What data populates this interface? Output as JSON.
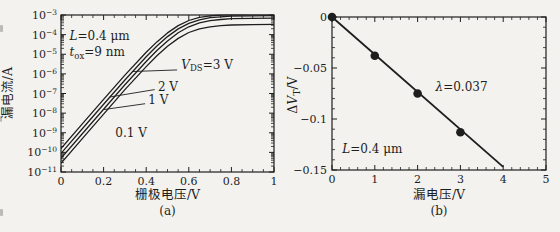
{
  "page": {
    "background": "#f3f2ee",
    "ink": "#1e1e1e"
  },
  "chart_data": [
    {
      "id": "a",
      "type": "line",
      "xlabel": "栅极电压/V",
      "ylabel": "漏电流/A",
      "caption": "(a)",
      "xlim": [
        0,
        1
      ],
      "x_ticks": [
        0,
        0.2,
        0.4,
        0.6,
        0.8,
        1
      ],
      "x_tick_labels": [
        "0",
        "0.2",
        "0.4",
        "0.6",
        "0.8",
        "1"
      ],
      "x_minor_step": 0.05,
      "y_scale": "log",
      "ylim_log": [
        -11,
        -3
      ],
      "y_exponent_ticks": [
        -3,
        -4,
        -5,
        -6,
        -7,
        -8,
        -9,
        -10,
        -11
      ],
      "grid": false,
      "annotations": [
        {
          "anchor": [
            0.04,
            -4.25
          ],
          "tokens": [
            [
              "i",
              "L"
            ],
            [
              "",
              "=0.4 μm"
            ]
          ]
        },
        {
          "anchor": [
            0.04,
            -5.1
          ],
          "tokens": [
            [
              "i",
              "t"
            ],
            [
              "sub",
              "ox"
            ],
            [
              "",
              "=9 nm"
            ]
          ]
        }
      ],
      "series": [
        {
          "name": "VDS-3V",
          "label_tokens": [
            [
              "i",
              "V"
            ],
            [
              "sub",
              "DS"
            ],
            [
              "",
              "=3 V"
            ]
          ],
          "label_anchor": [
            0.565,
            -5.75
          ],
          "leader": {
            "from": [
              0.545,
              -5.8
            ],
            "to": [
              0.335,
              -5.88
            ]
          },
          "points": [
            [
              0,
              -9.8
            ],
            [
              0.1,
              -8.55
            ],
            [
              0.2,
              -7.3
            ],
            [
              0.3,
              -6.06
            ],
            [
              0.4,
              -4.9
            ],
            [
              0.45,
              -4.37
            ],
            [
              0.5,
              -3.91
            ],
            [
              0.55,
              -3.54
            ],
            [
              0.6,
              -3.28
            ],
            [
              0.65,
              -3.12
            ],
            [
              0.7,
              -3.04
            ],
            [
              0.75,
              -3.0
            ],
            [
              0.8,
              -2.98
            ],
            [
              0.9,
              -2.96
            ],
            [
              1,
              -2.95
            ]
          ]
        },
        {
          "name": "VDS-2V",
          "label_tokens": [
            [
              "",
              "2 V"
            ]
          ],
          "label_anchor": [
            0.455,
            -6.88
          ],
          "leader": {
            "from": [
              0.44,
              -6.8
            ],
            "to": [
              0.228,
              -7.18
            ]
          },
          "points": [
            [
              0,
              -10.05
            ],
            [
              0.1,
              -8.8
            ],
            [
              0.2,
              -7.55
            ],
            [
              0.3,
              -6.31
            ],
            [
              0.4,
              -5.13
            ],
            [
              0.45,
              -4.58
            ],
            [
              0.5,
              -4.1
            ],
            [
              0.55,
              -3.71
            ],
            [
              0.6,
              -3.43
            ],
            [
              0.65,
              -3.25
            ],
            [
              0.7,
              -3.14
            ],
            [
              0.75,
              -3.09
            ],
            [
              0.8,
              -3.05
            ],
            [
              0.9,
              -3.04
            ],
            [
              1,
              -3.03
            ]
          ]
        },
        {
          "name": "VDS-1V",
          "label_tokens": [
            [
              "",
              "1 V"
            ]
          ],
          "label_anchor": [
            0.41,
            -7.55
          ],
          "leader": {
            "from": [
              0.395,
              -7.52
            ],
            "to": [
              0.2,
              -7.82
            ]
          },
          "points": [
            [
              0,
              -10.3
            ],
            [
              0.1,
              -9.05
            ],
            [
              0.2,
              -7.8
            ],
            [
              0.3,
              -6.55
            ],
            [
              0.4,
              -5.37
            ],
            [
              0.45,
              -4.81
            ],
            [
              0.5,
              -4.32
            ],
            [
              0.55,
              -3.9
            ],
            [
              0.6,
              -3.6
            ],
            [
              0.65,
              -3.4
            ],
            [
              0.7,
              -3.29
            ],
            [
              0.75,
              -3.23
            ],
            [
              0.8,
              -3.19
            ],
            [
              0.9,
              -3.17
            ],
            [
              1,
              -3.16
            ]
          ]
        },
        {
          "name": "VDS-0.1V",
          "label_tokens": [
            [
              "",
              "0.1 V"
            ]
          ],
          "label_anchor": [
            0.255,
            -9.2
          ],
          "points": [
            [
              0,
              -10.55
            ],
            [
              0.1,
              -9.3
            ],
            [
              0.2,
              -8.05
            ],
            [
              0.3,
              -6.8
            ],
            [
              0.4,
              -5.63
            ],
            [
              0.45,
              -5.08
            ],
            [
              0.5,
              -4.59
            ],
            [
              0.55,
              -4.19
            ],
            [
              0.6,
              -3.89
            ],
            [
              0.65,
              -3.71
            ],
            [
              0.7,
              -3.6
            ],
            [
              0.75,
              -3.54
            ],
            [
              0.8,
              -3.51
            ],
            [
              0.9,
              -3.49
            ],
            [
              1,
              -3.48
            ]
          ]
        }
      ]
    },
    {
      "id": "b",
      "type": "scatter",
      "xlabel": "漏电压/V",
      "ylabel_tokens": [
        [
          "",
          "Δ"
        ],
        [
          "i",
          "V"
        ],
        [
          "sub",
          "T"
        ],
        [
          "",
          "/V"
        ]
      ],
      "caption": "(b)",
      "xlim": [
        0,
        5
      ],
      "x_ticks": [
        0,
        1,
        2,
        3,
        4,
        5
      ],
      "x_tick_labels": [
        "0",
        "1",
        "2",
        "3",
        "4",
        "5"
      ],
      "x_minor_step": 0.2,
      "ylim": [
        -0.15,
        0
      ],
      "y_ticks": [
        0,
        -0.05,
        -0.1,
        -0.15
      ],
      "y_tick_labels": [
        "0",
        "−0.05",
        "−0.1",
        "−0.15"
      ],
      "y_minor_step": 0.01,
      "grid": false,
      "points": [
        [
          0,
          0
        ],
        [
          1,
          -0.038
        ],
        [
          2,
          -0.075
        ],
        [
          3,
          -0.113
        ]
      ],
      "fit_line": {
        "x1": 0,
        "y1": 0,
        "x2": 4,
        "y2": -0.147,
        "slope": -0.037
      },
      "annotations": [
        {
          "anchor": [
            2.42,
            -0.0725
          ],
          "tokens": [
            [
              "i",
              "λ"
            ],
            [
              "",
              "=0.037"
            ]
          ]
        },
        {
          "anchor": [
            0.24,
            -0.133
          ],
          "tokens": [
            [
              "i",
              "L"
            ],
            [
              "",
              "=0.4 μm"
            ]
          ]
        }
      ]
    }
  ]
}
